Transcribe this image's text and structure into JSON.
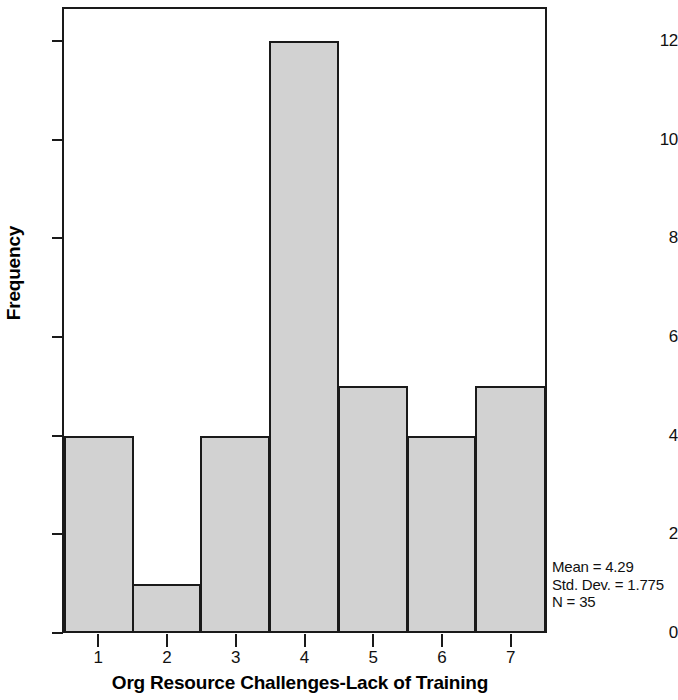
{
  "chart_data": {
    "type": "bar",
    "title": "",
    "xlabel": "Org Resource Challenges-Lack of Training",
    "ylabel": "Frequency",
    "categories": [
      "1",
      "2",
      "3",
      "4",
      "5",
      "6",
      "7"
    ],
    "values": [
      4,
      1,
      4,
      12,
      5,
      4,
      5
    ],
    "x": [
      1,
      2,
      3,
      4,
      5,
      6,
      7
    ],
    "bin_edges": [
      0.5,
      1.5,
      2.5,
      3.5,
      4.5,
      5.5,
      6.5,
      7.5
    ],
    "xlim": [
      0.5,
      7.5
    ],
    "ylim": [
      0,
      12.65
    ],
    "y_ticks": [
      0,
      2,
      4,
      6,
      8,
      10,
      12
    ],
    "y_tick_labels": [
      "0",
      "2",
      "4",
      "6",
      "8",
      "10",
      "12"
    ],
    "x_ticks": [
      1,
      2,
      3,
      4,
      5,
      6,
      7
    ],
    "x_tick_labels": [
      "1",
      "2",
      "3",
      "4",
      "5",
      "6",
      "7"
    ],
    "grid": false,
    "legend": null,
    "bar_fill_color": "#d2d2d2",
    "bar_edge_color": "#1a1a1a",
    "background_color": "#ffffff",
    "annotations": {
      "position": "bottom-right-outside",
      "lines": [
        "Mean = 4.29",
        "Std. Dev. = 1.775",
        "N = 35"
      ]
    }
  },
  "axes": {
    "y_title": "Frequency",
    "x_title": "Org Resource Challenges-Lack of Training",
    "y_tick_labels": [
      "12",
      "10",
      "8",
      "6",
      "4",
      "2",
      "0"
    ],
    "x_tick_labels": [
      "1",
      "2",
      "3",
      "4",
      "5",
      "6",
      "7"
    ]
  },
  "statistics": {
    "mean_label": "Mean = 4.29",
    "std_dev_label": "Std. Dev. = 1.775",
    "n_label": "N = 35"
  }
}
